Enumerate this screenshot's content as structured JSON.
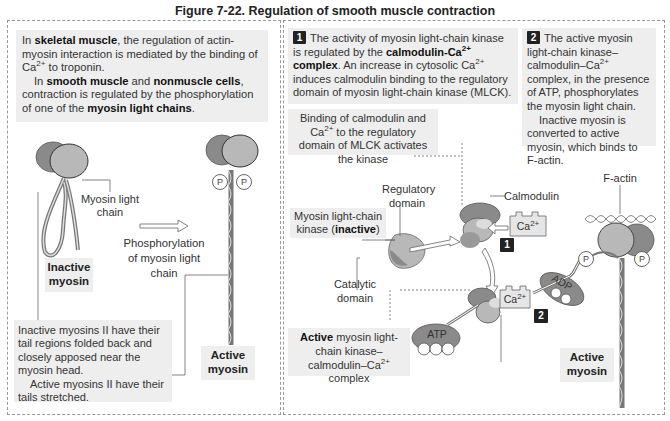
{
  "figure": {
    "title": "Figure 7-22. Regulation of smooth muscle contraction"
  },
  "left_panel": {
    "intro": {
      "p1_pre": "In ",
      "p1_bold1": "skeletal muscle",
      "p1_mid": ", the regulation of actin-myosin interaction is mediated by the binding of Ca",
      "p1_sup": "2+",
      "p1_post": " to troponin.",
      "p2_pre": "In ",
      "p2_bold1": "smooth muscle",
      "p2_and": " and ",
      "p2_bold2": "nonmuscle cells",
      "p2_mid": ", contraction is regulated by the phosphorylation of one of the ",
      "p2_bold3": "myosin light chains",
      "p2_post": "."
    },
    "myosin_light_chain_label": "Myosin light chain",
    "arrow_label": "Phosphorylation of myosin light chain",
    "inactive_label": "Inactive myosin",
    "active_label": "Active myosin",
    "phosphate_symbol": "P",
    "note": {
      "line1": "Inactive myosins II have their tail regions folded back and closely apposed near the myosin head.",
      "line2": "Active myosins II have their tails stretched."
    }
  },
  "right_panel": {
    "step1": {
      "number": "1",
      "pre": "The activity of myosin light-chain kinase is regulated by the ",
      "bold": "calmodulin-Ca",
      "bold_sup": "2+",
      "bold_post": " complex",
      "mid": ". An increase in cytosolic Ca",
      "sup": "2+",
      "post": " induces calmodulin binding to the regulatory domain of myosin light-chain kinase (MLCK)."
    },
    "step2": {
      "number": "2",
      "pre": "The active myosin light-chain kinase–calmodulin–Ca",
      "sup": "2+",
      "post": " complex, in the presence of ATP, phosphorylates the myosin light chain.",
      "line2": "Inactive myosin is converted to active myosin, which binds to F-actin."
    },
    "binding_note": {
      "pre": "Binding of calmodulin and Ca",
      "sup": "2+",
      "post": " to the regulatory domain of MLCK activates the kinase"
    },
    "regulatory_domain_label": "Regulatory domain",
    "calmodulin_label": "Calmodulin",
    "mlck_label_pre": "Myosin light-chain kinase (",
    "mlck_label_bold": "inactive",
    "mlck_label_post": ")",
    "catalytic_domain_label": "Catalytic domain",
    "ca_label": "Ca",
    "ca_sup": "2+",
    "atp_label": "ATP",
    "adp_label": "ADP",
    "f_actin_label": "F-actin",
    "active_complex": {
      "bold": "Active",
      "pre": " myosin light-chain kinase–calmodulin–Ca",
      "sup": "2+",
      "post": " complex"
    },
    "active_myosin_label": "Active myosin",
    "phosphate_symbol": "P",
    "badge1": "1",
    "badge2": "2"
  },
  "colors": {
    "box_bg": "#eeeeee",
    "head_dark": "#8a8a8a",
    "head_light": "#b8b8b8",
    "badge": "#222222"
  }
}
